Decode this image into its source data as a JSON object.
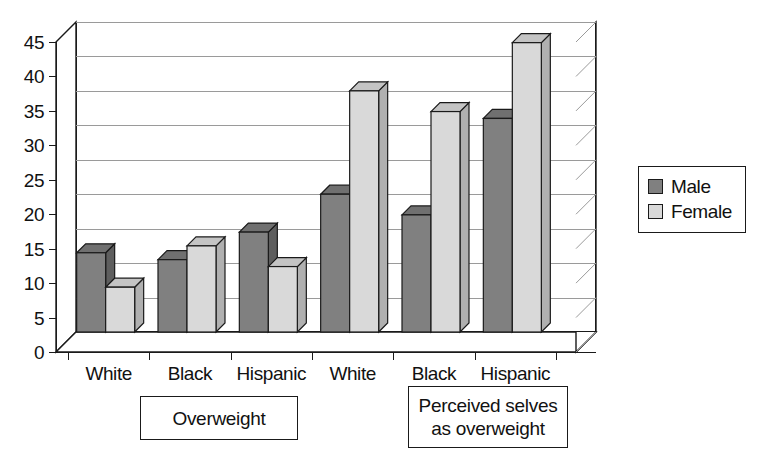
{
  "chart_data": {
    "type": "bar",
    "title": "",
    "subtitle": "",
    "xlabel": "",
    "ylabel": "",
    "ylim": [
      0,
      45
    ],
    "ytick_step": 5,
    "yticks": [
      0,
      5,
      10,
      15,
      20,
      25,
      30,
      35,
      40,
      45
    ],
    "grid": true,
    "legend_position": "right",
    "style": "3d-clustered-column",
    "categories": [
      "White",
      "Black",
      "Hispanic",
      "White",
      "Black",
      "Hispanic"
    ],
    "series": [
      {
        "name": "Male",
        "color": "#808080",
        "values": [
          11.5,
          10.5,
          14.5,
          20,
          17,
          31
        ]
      },
      {
        "name": "Female",
        "color": "#d9d9d9",
        "values": [
          6.5,
          12.5,
          9.5,
          35,
          32,
          42
        ]
      }
    ],
    "groups": [
      {
        "label": "Overweight",
        "categories": [
          "White",
          "Black",
          "Hispanic"
        ]
      },
      {
        "label": "Perceived selves as overweight",
        "categories": [
          "White",
          "Black",
          "Hispanic"
        ]
      }
    ],
    "annotations": [
      {
        "text": "Overweight"
      },
      {
        "text": "Perceived selves as overweight"
      }
    ]
  },
  "axes": {
    "y_tick_labels": [
      "45",
      "40",
      "35",
      "30",
      "25",
      "20",
      "15",
      "10",
      "5",
      "0"
    ],
    "x_tick_labels": [
      "White",
      "Black",
      "Hispanic",
      "White",
      "Black",
      "Hispanic"
    ]
  },
  "legend": {
    "items": [
      {
        "label": "Male",
        "color": "#808080"
      },
      {
        "label": "Female",
        "color": "#d9d9d9"
      }
    ]
  },
  "annotations": {
    "overweight": "Overweight",
    "perceived_line1": "Perceived selves",
    "perceived_line2": "as overweight"
  },
  "colors": {
    "male": "#808080",
    "female": "#d9d9d9",
    "male_top": "#707070",
    "female_top": "#c4c4c4",
    "male_side": "#5e5e5e",
    "female_side": "#b0b0b0",
    "axis": "#1a1a1a",
    "grid": "#9a9a9a",
    "background": "#ffffff"
  }
}
